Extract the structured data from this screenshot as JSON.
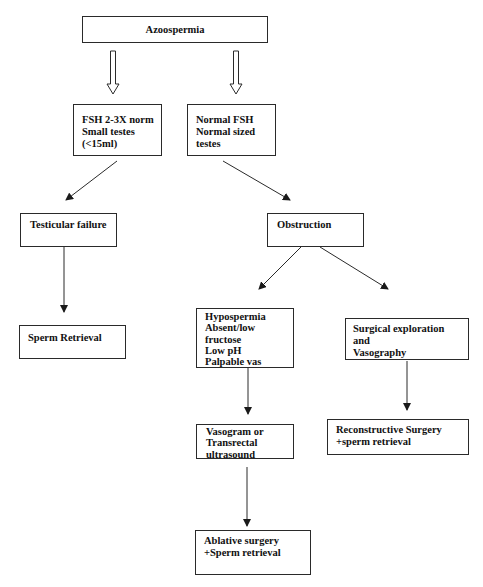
{
  "diagram": {
    "type": "flowchart",
    "title": "Azoospermia",
    "nodes": [
      {
        "id": "root",
        "label": "Azoospermia"
      },
      {
        "id": "fsh_high",
        "label": "FSH 2-3X norm\nSmall testes\n(<15ml)"
      },
      {
        "id": "fsh_normal",
        "label": "Normal FSH\nNormal sized\ntestes"
      },
      {
        "id": "testicular_failure",
        "label": "Testicular failure"
      },
      {
        "id": "obstruction",
        "label": "Obstruction"
      },
      {
        "id": "sperm_retrieval",
        "label": "Sperm Retrieval"
      },
      {
        "id": "hypospermia",
        "label": "Hypospermia\nAbsent/low\nfructose\nLow pH\nPalpable vas"
      },
      {
        "id": "surgical_exploration",
        "label": "Surgical exploration and\nVasography"
      },
      {
        "id": "vasogram",
        "label": "Vasogram or\nTransrectal\nultrasound"
      },
      {
        "id": "reconstructive",
        "label": "Reconstructive Surgery\n+sperm retrieval"
      },
      {
        "id": "ablative",
        "label": "Ablative surgery\n+Sperm retrieval"
      }
    ],
    "edges": [
      {
        "from": "root",
        "to": "fsh_high",
        "style": "hollow-block-arrow"
      },
      {
        "from": "root",
        "to": "fsh_normal",
        "style": "hollow-block-arrow"
      },
      {
        "from": "fsh_high",
        "to": "testicular_failure",
        "style": "line-arrow"
      },
      {
        "from": "fsh_normal",
        "to": "obstruction",
        "style": "line-arrow"
      },
      {
        "from": "testicular_failure",
        "to": "sperm_retrieval",
        "style": "line-arrow"
      },
      {
        "from": "obstruction",
        "to": "hypospermia",
        "style": "line-arrow"
      },
      {
        "from": "obstruction",
        "to": "surgical_exploration",
        "style": "line-arrow"
      },
      {
        "from": "hypospermia",
        "to": "vasogram",
        "style": "line-arrow"
      },
      {
        "from": "surgical_exploration",
        "to": "reconstructive",
        "style": "line-arrow"
      },
      {
        "from": "vasogram",
        "to": "ablative",
        "style": "line-arrow"
      }
    ]
  },
  "labels": {
    "root": "Azoospermia",
    "fsh_high": "FSH 2-3X norm\nSmall testes\n(<15ml)",
    "fsh_normal": "Normal FSH\nNormal sized\ntestes",
    "testicular_failure": "Testicular failure",
    "obstruction": "Obstruction",
    "sperm_retrieval": "Sperm Retrieval",
    "hypospermia": "Hypospermia\nAbsent/low\nfructose\nLow pH\nPalpable vas",
    "surgical_exploration": "Surgical exploration and\nVasography",
    "vasogram": "Vasogram or\nTransrectal\nultrasound",
    "reconstructive": "Reconstructive Surgery\n+sperm retrieval",
    "ablative": "Ablative surgery\n+Sperm retrieval"
  },
  "colors": {
    "line": "#2a2a2a",
    "background": "#ffffff",
    "text": "#111111"
  }
}
